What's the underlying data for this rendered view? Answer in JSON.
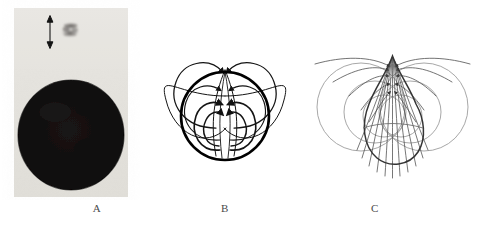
{
  "figure": {
    "panels": [
      {
        "id": "A",
        "label": "A",
        "kind": "photograph",
        "description": "grayscale photograph of a dark circular disc with a small blurry dark spot and a vertical double-headed scale arrow above it",
        "features": {
          "background_tone": "#e8e6e1",
          "disc_color": "#0d0c0c",
          "spot_color": "#6e6a68",
          "arrow_color": "#1a1a1a",
          "arrow_kind": "double-headed-vertical-arrow"
        }
      },
      {
        "id": "B",
        "label": "B",
        "kind": "line-diagram",
        "description": "magnetic field line diagram: bold circular boundary with symmetric flux loops arching outward left and right, arrowheads directed inward toward the top pole",
        "features": {
          "boundary_color": "#000000",
          "fieldline_color": "#1a1a1a",
          "boundary_shape": "circle",
          "symmetry": "left-right mirror",
          "arrow_direction": "inward-to-top-pole"
        }
      },
      {
        "id": "C",
        "label": "C",
        "kind": "line-diagram",
        "description": "magnetic field line diagram: teardrop / pear shaped boundary with a narrow cusp at the top where many field lines converge, broad bulb below, surrounded by large light gray circular loops",
        "features": {
          "boundary_color": "#3a3a3a",
          "fieldline_color": "#555555",
          "outer_loop_color": "#9a9a9a",
          "boundary_shape": "teardrop",
          "symmetry": "left-right mirror",
          "arrow_direction": "converging-at-cusp"
        }
      }
    ],
    "caption_fragment": ""
  }
}
